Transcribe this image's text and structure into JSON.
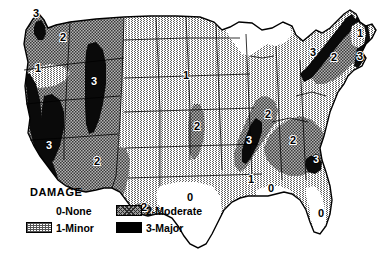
{
  "legend": {
    "heading": "DAMAGE",
    "items": [
      {
        "key": "0",
        "label": "0-None",
        "swatch": "none",
        "color": "#ffffff"
      },
      {
        "key": "2",
        "label": "2-Moderate",
        "swatch": "mod",
        "color": "#8c8c8c"
      },
      {
        "key": "1",
        "label": "1-Minor",
        "swatch": "minor",
        "color": "#dcdcdc"
      },
      {
        "key": "3",
        "label": "3-Major",
        "swatch": "major",
        "color": "#000000"
      }
    ]
  },
  "colors": {
    "none": "#ffffff",
    "minor": "#dcdcdc",
    "moderate": "#8c8c8c",
    "major": "#000000",
    "outline": "#000000",
    "background": "#ffffff"
  },
  "map": {
    "zone_labels": [
      {
        "value": "3",
        "region": "puget-sound",
        "x": 36,
        "y": 17,
        "on_black": false
      },
      {
        "value": "2",
        "region": "pacific-northwest",
        "x": 63,
        "y": 41,
        "on_black": false
      },
      {
        "value": "1",
        "region": "eastern-oregon",
        "x": 38,
        "y": 72,
        "on_black": false
      },
      {
        "value": "3",
        "region": "intermountain-belt",
        "x": 94,
        "y": 85,
        "on_black": true
      },
      {
        "value": "3",
        "region": "california-coast",
        "x": 49,
        "y": 149,
        "on_black": true
      },
      {
        "value": "2",
        "region": "southwest-arizona",
        "x": 97,
        "y": 165,
        "on_black": false
      },
      {
        "value": "1",
        "region": "northern-plains",
        "x": 186,
        "y": 79,
        "on_black": false
      },
      {
        "value": "2",
        "region": "missouri-river",
        "x": 197,
        "y": 130,
        "on_black": false
      },
      {
        "value": "2",
        "region": "west-texas",
        "x": 144,
        "y": 211,
        "on_black": false
      },
      {
        "value": "0",
        "region": "texas-interior",
        "x": 190,
        "y": 201,
        "on_black": false
      },
      {
        "value": "3",
        "region": "new-madrid",
        "x": 249,
        "y": 144,
        "on_black": true
      },
      {
        "value": "2",
        "region": "wabash-valley",
        "x": 268,
        "y": 118,
        "on_black": false
      },
      {
        "value": "1",
        "region": "lower-mississippi",
        "x": 251,
        "y": 183,
        "on_black": false
      },
      {
        "value": "0",
        "region": "gulf-coast",
        "x": 271,
        "y": 192,
        "on_black": false
      },
      {
        "value": "2",
        "region": "southern-appalach",
        "x": 293,
        "y": 144,
        "on_black": false
      },
      {
        "value": "3",
        "region": "charleston-sc",
        "x": 316,
        "y": 163,
        "on_black": true
      },
      {
        "value": "0",
        "region": "florida",
        "x": 321,
        "y": 217,
        "on_black": false
      },
      {
        "value": "3",
        "region": "adirondack",
        "x": 313,
        "y": 56,
        "on_black": false
      },
      {
        "value": "2",
        "region": "new-england",
        "x": 334,
        "y": 61,
        "on_black": false
      },
      {
        "value": "3",
        "region": "coastal-new-england",
        "x": 360,
        "y": 60,
        "on_black": false
      },
      {
        "value": "1",
        "region": "northern-maine",
        "x": 360,
        "y": 37,
        "on_black": false
      }
    ]
  }
}
